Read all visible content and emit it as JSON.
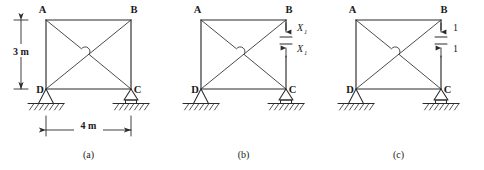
{
  "figure": {
    "background_color": "#ffffff",
    "line_color": "#2b2b2b",
    "panels": [
      {
        "id": "a",
        "caption": "(a)",
        "joint_labels": {
          "top_left": "A",
          "top_right": "B",
          "bottom_left": "D",
          "bottom_right": "C"
        },
        "dimensions": [
          {
            "name": "height",
            "value": "3 m",
            "orientation": "vertical"
          },
          {
            "name": "span",
            "value": "4 m",
            "orientation": "horizontal"
          }
        ],
        "supports": [
          {
            "joint": "D",
            "type": "pin-support"
          },
          {
            "joint": "C",
            "type": "roller-support"
          }
        ],
        "force_labels": []
      },
      {
        "id": "b",
        "caption": "(b)",
        "joint_labels": {
          "top_left": "A",
          "top_right": "B",
          "bottom_left": "D",
          "bottom_right": "C"
        },
        "dimensions": [],
        "supports": [
          {
            "joint": "D",
            "type": "pin-support"
          },
          {
            "joint": "C",
            "type": "roller-support"
          }
        ],
        "force_labels": [
          {
            "text": "X",
            "subscript": "1",
            "direction": "down",
            "member": "BC"
          },
          {
            "text": "X",
            "subscript": "1",
            "direction": "up",
            "member": "BC"
          }
        ]
      },
      {
        "id": "c",
        "caption": "(c)",
        "joint_labels": {
          "top_left": "A",
          "top_right": "B",
          "bottom_left": "D",
          "bottom_right": "C"
        },
        "dimensions": [],
        "supports": [
          {
            "joint": "D",
            "type": "pin-support"
          },
          {
            "joint": "C",
            "type": "roller-support"
          }
        ],
        "force_labels": [
          {
            "text": "1",
            "subscript": "",
            "direction": "down",
            "member": "BC"
          },
          {
            "text": "1",
            "subscript": "",
            "direction": "up",
            "member": "BC"
          }
        ]
      }
    ]
  }
}
